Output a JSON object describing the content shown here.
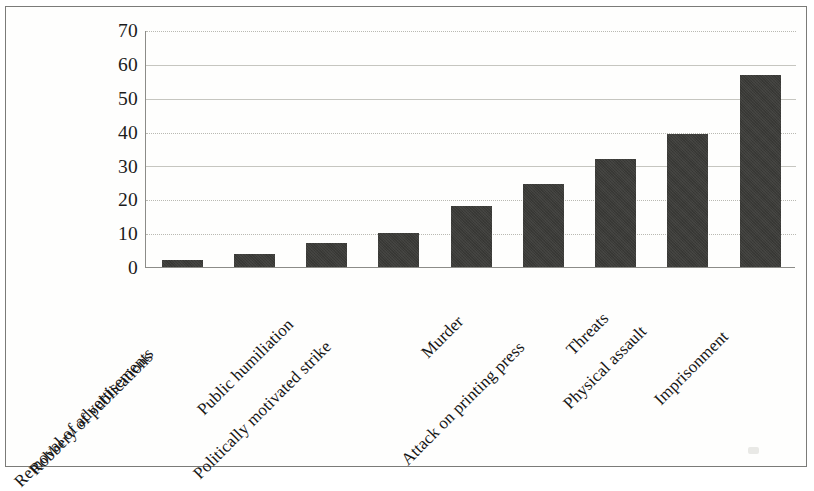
{
  "chart_data": {
    "type": "bar",
    "title": "",
    "subtitle": "",
    "xlabel": "",
    "ylabel": "",
    "ylim": [
      0,
      70
    ],
    "ytick_step": 10,
    "yticks": [
      "70",
      "60",
      "50",
      "40",
      "30",
      "20",
      "10",
      "0"
    ],
    "grid": "horizontal",
    "legend": "none",
    "bar_color": "#3b3b38",
    "gridline_color": "#b9b9b2",
    "axis_color": "#8c8c88",
    "categories": [
      "Robbery of publications",
      "Removal of advertisements",
      "Public humiliation",
      "Politically motivated strike",
      "Murder",
      "Attack on printing press",
      "Threats",
      "Physical assault",
      "Imprisonment"
    ],
    "values": [
      2,
      4,
      7,
      10,
      18,
      24.5,
      32,
      39.5,
      57
    ]
  }
}
